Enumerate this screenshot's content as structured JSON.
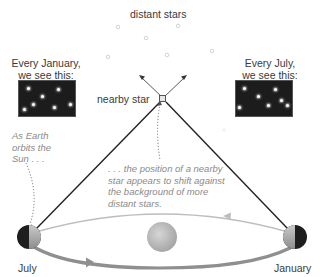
{
  "title": "distant stars",
  "nearby_star_label": "nearby star",
  "january_view": {
    "line1": "Every January,",
    "line2": "we see this:"
  },
  "july_view": {
    "line1": "Every July,",
    "line2": "we see this:"
  },
  "caption_left": {
    "line1": "As Earth",
    "line2": "orbits the",
    "line3": "Sun . . ."
  },
  "caption_center": {
    "line1": ". . . the position of a nearby",
    "line2": "star appears to shift against",
    "line3": "the background of more",
    "line4": "distant stars."
  },
  "earth_labels": {
    "left": "July",
    "right": "January"
  },
  "icons": {
    "sun": "sun-icon",
    "earth": "earth-icon",
    "star": "star-icon"
  },
  "colors": {
    "sky_box": "#1c1c1c",
    "sight_line": "#222222",
    "orbit_top": "#b8b8b8",
    "orbit_bottom": "#8f8f8f",
    "sun": "#bdbdbd",
    "caption": "#8a8a8a"
  }
}
